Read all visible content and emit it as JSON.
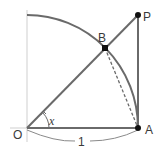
{
  "diagram": {
    "points": {
      "O": {
        "label": "O",
        "x": 27,
        "y": 128
      },
      "A": {
        "label": "A",
        "x": 138,
        "y": 128
      },
      "P": {
        "label": "P",
        "x": 138,
        "y": 15
      },
      "B": {
        "label": "B",
        "x": 105,
        "y": 48
      }
    },
    "angle_label": "x",
    "radius_label": "1",
    "colors": {
      "stroke": "#6a6a6a",
      "axis": "#c8c8c8",
      "point": "#111111",
      "text": "#3a3a3a"
    }
  }
}
